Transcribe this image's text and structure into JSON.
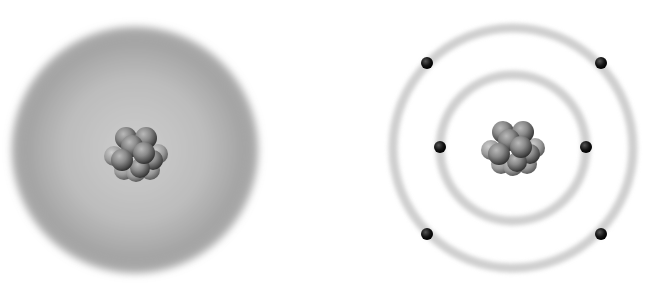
{
  "figure": {
    "title": "",
    "left_model": {
      "name": "electron-cloud-model",
      "center": [
        135,
        150
      ],
      "cloud_radius": 125,
      "cloud_color_center": "#c8c8c8",
      "cloud_color_edge": "#8e8e8e",
      "nucleus": {
        "center": [
          136,
          152
        ],
        "particle_count": 13
      }
    },
    "right_model": {
      "name": "bohr-orbit-model",
      "center": [
        513,
        148
      ],
      "orbits": [
        {
          "name": "inner-orbit",
          "radius": 73,
          "electrons": 2
        },
        {
          "name": "outer-orbit",
          "radius": 120,
          "electrons": 4
        }
      ],
      "electrons": [
        {
          "orbit": "outer",
          "position": [
            427,
            63
          ]
        },
        {
          "orbit": "outer",
          "position": [
            601,
            63
          ]
        },
        {
          "orbit": "inner",
          "position": [
            440,
            147
          ]
        },
        {
          "orbit": "inner",
          "position": [
            586,
            147
          ]
        },
        {
          "orbit": "outer",
          "position": [
            427,
            234
          ]
        },
        {
          "orbit": "outer",
          "position": [
            601,
            234
          ]
        }
      ],
      "orbit_color": "#cfcfcf",
      "electron_color": "#111111",
      "nucleus": {
        "center": [
          513,
          146
        ],
        "particle_count": 13
      }
    }
  }
}
